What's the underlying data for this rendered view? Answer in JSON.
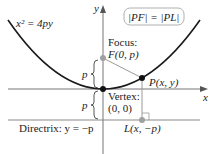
{
  "diagram": {
    "equation": "x² = 4py",
    "condition": "|PF| = |PL|",
    "focus_label": "Focus:",
    "focus_point": "F(0, p)",
    "vertex_label": "Vertex:",
    "vertex_point": "(0, 0)",
    "point_p": "P(x, y)",
    "point_l": "L(x, −p)",
    "directrix_label": "Directrix: y = −p",
    "x_axis": "x",
    "y_axis": "y",
    "p_upper": "p",
    "p_lower": "p",
    "colors": {
      "parabola": "#1a1a1a",
      "axis": "#555555",
      "segment": "#9a9a9a",
      "focus": "#a0a0a0",
      "box_border": "#b0b0b0"
    }
  }
}
